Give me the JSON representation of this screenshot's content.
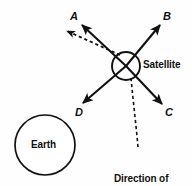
{
  "figure": {
    "background_color": "#fefefe",
    "stroke_color": "#111111",
    "text_color": "#111111"
  },
  "bodies": {
    "earth": {
      "label": "Earth",
      "shape": "circle",
      "center_x": 45,
      "center_y": 145,
      "radius": 30
    },
    "satellite": {
      "label": "Satellite",
      "shape": "circle-with-cross",
      "center_x": 126,
      "center_y": 66,
      "radius": 14
    }
  },
  "vectors": [
    {
      "id": "A",
      "label": "A",
      "style": "solid",
      "direction": "up-left",
      "from_x": 126,
      "from_y": 66,
      "to_x": 82,
      "to_y": 25
    },
    {
      "id": "B",
      "label": "B",
      "style": "solid",
      "direction": "up-right",
      "from_x": 126,
      "from_y": 66,
      "to_x": 160,
      "to_y": 25
    },
    {
      "id": "C",
      "label": "C",
      "style": "solid",
      "direction": "down-right",
      "from_x": 126,
      "from_y": 66,
      "to_x": 162,
      "to_y": 104
    },
    {
      "id": "D",
      "label": "D",
      "style": "solid",
      "direction": "down-left",
      "from_x": 126,
      "from_y": 66,
      "to_x": 83,
      "to_y": 103
    },
    {
      "id": "motion",
      "label": "Direction of movement",
      "style": "dashed",
      "direction": "up-left",
      "from_x": 120,
      "from_y": 55,
      "to_x": 67,
      "to_y": 31
    }
  ],
  "annotations": {
    "direction_caption": "Direction of\nmovement",
    "direction_caption_line1": "Direction of",
    "direction_caption_line2": "movement",
    "leader_line": {
      "style": "dashed",
      "from_x": 138,
      "from_y": 147,
      "to_x": 131,
      "to_y": 78
    }
  }
}
